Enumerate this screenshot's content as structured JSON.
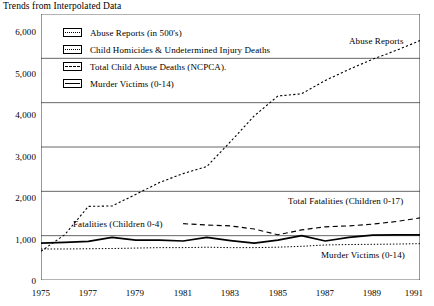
{
  "chart_data": {
    "type": "line",
    "title": "Trends from Interpolated Data",
    "xlabel": "",
    "ylabel": "",
    "xlim": [
      1975,
      1991
    ],
    "ylim": [
      0,
      6000
    ],
    "grid": true,
    "legend_position": "upper-left-inside",
    "x_ticks": [
      1975,
      1977,
      1979,
      1981,
      1983,
      1985,
      1987,
      1989,
      1991
    ],
    "x_minor_ticks": [
      1976,
      1978,
      1980,
      1982,
      1984,
      1986,
      1988,
      1990
    ],
    "y_ticks": [
      0,
      1000,
      2000,
      3000,
      4000,
      5000,
      6000
    ],
    "y_tick_labels": [
      "0",
      "1,000",
      "2,000",
      "3,000",
      "4,000",
      "5,000",
      "6,000"
    ],
    "x": [
      1975,
      1976,
      1977,
      1978,
      1979,
      1980,
      1981,
      1982,
      1983,
      1984,
      1985,
      1986,
      1987,
      1988,
      1989,
      1990,
      1991
    ],
    "series": [
      {
        "name": "Abuse Reports (in 500's)",
        "style": "dotted",
        "values": [
          650,
          1020,
          1660,
          1670,
          1930,
          2200,
          2400,
          2560,
          3120,
          3700,
          4150,
          4200,
          4500,
          4750,
          4980,
          5180,
          5400
        ]
      },
      {
        "name": "Child Homicides & Undetermined Injury Deaths",
        "style": "dashed",
        "values": [
          null,
          null,
          null,
          null,
          null,
          null,
          1270,
          1240,
          1220,
          1150,
          1020,
          1130,
          1200,
          1220,
          1260,
          1320,
          1400
        ]
      },
      {
        "name": "Total Child Abuse Deaths (NCPCA).",
        "style": "solid",
        "values": [
          830,
          850,
          870,
          960,
          900,
          900,
          880,
          960,
          890,
          830,
          900,
          1000,
          880,
          960,
          1010,
          1020,
          1020
        ]
      },
      {
        "name": "Murder Victims (0-14)",
        "style": "fine-dotted",
        "values": [
          700,
          700,
          705,
          710,
          720,
          730,
          730,
          740,
          730,
          730,
          740,
          760,
          790,
          800,
          805,
          810,
          820
        ]
      }
    ],
    "annotations": [
      {
        "text": "Abuse Reports",
        "x": 1989.0,
        "y": 5650
      },
      {
        "text": "Total Fatalities (Children 0-17)",
        "x": 1987.6,
        "y": 1700
      },
      {
        "text": "Fatalities (Children 0-4)",
        "x": 1977.5,
        "y": 1160
      },
      {
        "text": "Murder Victims (0-14)",
        "x": 1988.6,
        "y": 530
      }
    ]
  },
  "legend": {
    "items": [
      {
        "label": "Abuse Reports (in 500's)",
        "swatch": "dotted-line-swatch"
      },
      {
        "label": "Child Homicides & Undetermined Injury Deaths",
        "swatch": "dashed-line-swatch"
      },
      {
        "label": "Total Child Abuse Deaths (NCPCA).",
        "swatch": "dashed-line-swatch"
      },
      {
        "label": "Murder Victims (0-14)",
        "swatch": "solid-line-swatch"
      }
    ]
  },
  "colors": {
    "line": "#000000",
    "grid": "#555555",
    "background": "#ffffff"
  }
}
